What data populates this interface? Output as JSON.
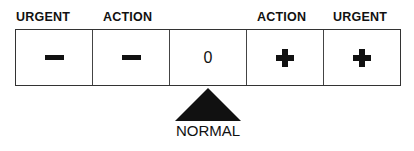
{
  "labels": {
    "left_urgent": "URGENT",
    "left_action": "ACTION",
    "right_action": "ACTION",
    "right_urgent": "URGENT"
  },
  "cells": [
    {
      "symbol": "minus-icon"
    },
    {
      "symbol": "minus-icon"
    },
    {
      "symbol": "zero",
      "text": "0"
    },
    {
      "symbol": "plus-icon"
    },
    {
      "symbol": "plus-icon"
    }
  ],
  "indicator": {
    "icon": "triangle-pointer-icon",
    "label": "NORMAL"
  }
}
